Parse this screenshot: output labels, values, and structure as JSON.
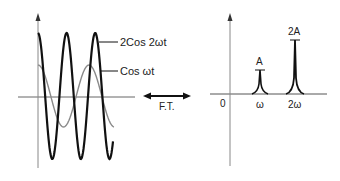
{
  "time_domain": {
    "curves": [
      {
        "label": "2Cos 2ωt",
        "amplitude": 2,
        "frequency_multiple": 2,
        "stroke": "#111111",
        "width": 2.2
      },
      {
        "label": "Cos ωt",
        "amplitude": 1,
        "frequency_multiple": 1,
        "stroke": "#8a8a8a",
        "width": 1.4
      }
    ]
  },
  "transform": {
    "label": "F.T."
  },
  "frequency_domain": {
    "origin_label": "0",
    "ticks": [
      "ω",
      "2ω"
    ],
    "peaks": [
      {
        "label": "A",
        "position": "ω",
        "relative_height": 1
      },
      {
        "label": "2A",
        "position": "2ω",
        "relative_height": 2
      }
    ]
  },
  "colors": {
    "axis": "#666666",
    "ink": "#111111",
    "light_curve": "#8a8a8a"
  }
}
